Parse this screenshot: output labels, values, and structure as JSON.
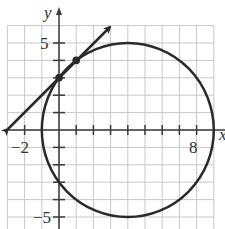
{
  "figure": {
    "axes": {
      "x_label": "x",
      "y_label": "y",
      "x_range": [
        -3,
        9
      ],
      "y_range": [
        -6,
        6
      ],
      "tick_labels": {
        "x": [
          {
            "value": -2,
            "text": "−2"
          },
          {
            "value": 8,
            "text": "8"
          }
        ],
        "y": [
          {
            "value": 5,
            "text": "5"
          },
          {
            "value": -5,
            "text": "−5"
          }
        ]
      }
    },
    "colors": {
      "grid": "#c8c8c8",
      "axis": "#3a3a3a",
      "curve": "#2a2a2a"
    }
  },
  "chart_data": {
    "type": "line",
    "title": "",
    "xlabel": "x",
    "ylabel": "y",
    "xlim": [
      -3,
      9
    ],
    "ylim": [
      -6,
      6
    ],
    "grid": true,
    "series": [
      {
        "name": "circle",
        "equation": "(x-4)^2 + y^2 = 25",
        "center": [
          4,
          0
        ],
        "radius": 5
      },
      {
        "name": "line",
        "equation": "y = x + 3",
        "x": [
          -3,
          3
        ],
        "y": [
          0,
          6
        ],
        "arrows": "both"
      }
    ],
    "points": [
      {
        "x": 0,
        "y": 3,
        "label": "intersection"
      },
      {
        "x": 1,
        "y": 4,
        "label": "intersection"
      }
    ]
  }
}
